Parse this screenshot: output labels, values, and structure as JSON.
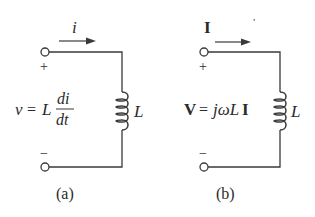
{
  "figure": {
    "panels": [
      {
        "id": "a",
        "caption": "(a)",
        "current_label": "i",
        "plus": "+",
        "minus": "−",
        "equation": {
          "lhs": "v",
          "eq": "=",
          "coef": "L",
          "num": "di",
          "den": "dt"
        },
        "inductor_label": "L"
      },
      {
        "id": "b",
        "caption": "(b)",
        "current_label": "I",
        "plus": "+",
        "minus": "−",
        "equation": {
          "lhs": "V",
          "eq": "=",
          "rhs": "jωL",
          "rhs_tail": "I"
        },
        "inductor_label": "L"
      }
    ],
    "colors": {
      "stroke": "#3a3a3a",
      "text": "#2a2a2a",
      "background": "#ffffff"
    }
  }
}
